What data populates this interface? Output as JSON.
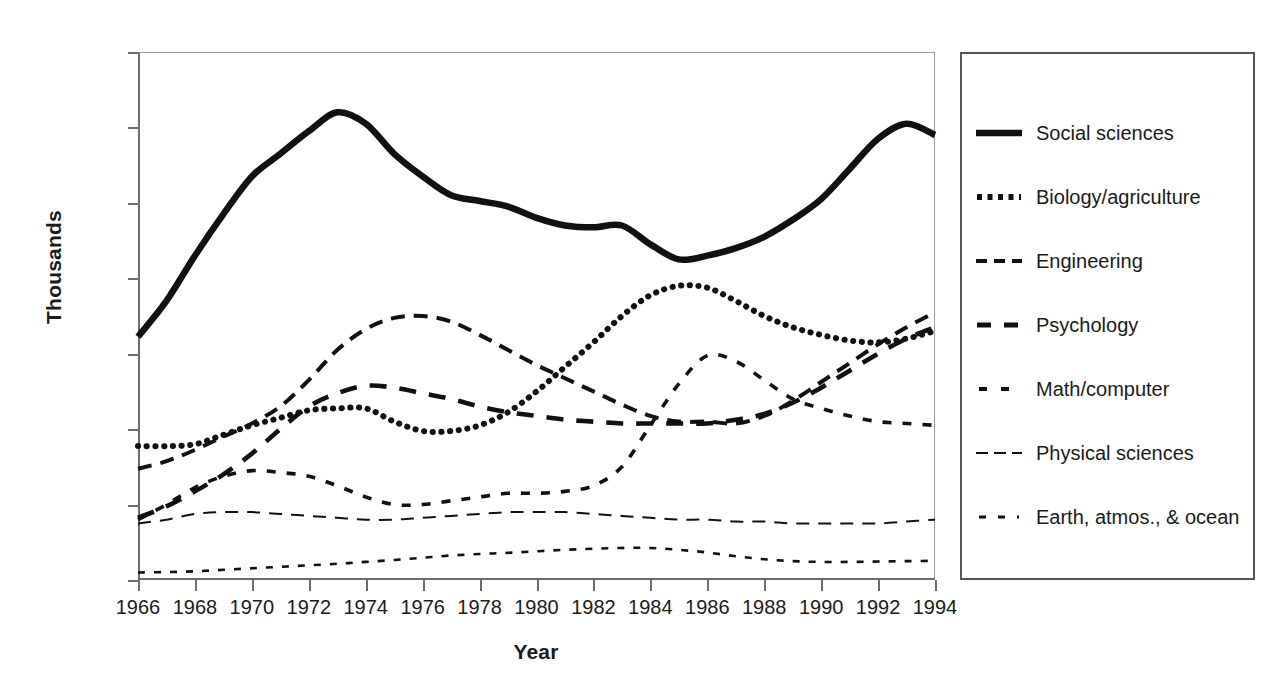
{
  "chart_data": {
    "type": "line",
    "title": "",
    "xlabel": "Year",
    "ylabel": "Thousands",
    "xlim": [
      1966,
      1994
    ],
    "ylim": [
      0,
      140
    ],
    "grid": false,
    "legend_position": "right",
    "xticks": [
      "1966",
      "1968",
      "1970",
      "1972",
      "1974",
      "1976",
      "1978",
      "1980",
      "1982",
      "1984",
      "1986",
      "1988",
      "1990",
      "1992",
      "1994"
    ],
    "yticks": [
      "0",
      "20",
      "40",
      "60",
      "80",
      "100",
      "120",
      "140"
    ],
    "x": [
      1966,
      1967,
      1968,
      1969,
      1970,
      1971,
      1972,
      1973,
      1974,
      1975,
      1976,
      1977,
      1978,
      1979,
      1980,
      1981,
      1982,
      1983,
      1984,
      1985,
      1986,
      1987,
      1988,
      1989,
      1990,
      1991,
      1992,
      1993,
      1994
    ],
    "series": [
      {
        "name": "Social sciences",
        "style": "solid-thick",
        "values": [
          64.5,
          74,
          86,
          97,
          107,
          113,
          119,
          124,
          121,
          113,
          107,
          102,
          100.5,
          99,
          96,
          94,
          93.5,
          94,
          89,
          85,
          86,
          88,
          91,
          95.5,
          101,
          109,
          117,
          121,
          118
        ]
      },
      {
        "name": "Biology/agriculture",
        "style": "dotted-thick",
        "values": [
          35.5,
          35.5,
          36,
          38.5,
          41,
          43,
          45,
          45.5,
          45.5,
          42,
          39.5,
          39.5,
          41,
          44.5,
          50,
          56.5,
          63,
          70,
          75.5,
          78,
          77.5,
          74,
          70,
          67,
          65,
          63.5,
          63,
          64,
          66
        ]
      },
      {
        "name": "Engineering",
        "style": "dashed-medium",
        "values": [
          29.5,
          31.5,
          34.5,
          38,
          41.5,
          46,
          53,
          61,
          66.5,
          69.5,
          70,
          68.5,
          65,
          61,
          57,
          53.5,
          50,
          46.5,
          43.5,
          42,
          42,
          41.5,
          43.5,
          47.5,
          52.5,
          57.5,
          62.5,
          67,
          71
        ]
      },
      {
        "name": "Psychology",
        "style": "dashed-long",
        "values": [
          16.5,
          19.5,
          23.5,
          28,
          33.5,
          40,
          46,
          49.5,
          51.5,
          51,
          49.5,
          48,
          46,
          44.5,
          43.5,
          42.5,
          42,
          41.5,
          41.5,
          41.5,
          41.5,
          42.5,
          44,
          47,
          51,
          55.5,
          60,
          64,
          67
        ]
      },
      {
        "name": "Math/computer",
        "style": "dashdot-small",
        "values": [
          16,
          20,
          24.5,
          27.5,
          29,
          28.5,
          27.5,
          25,
          22,
          20,
          20,
          21,
          22,
          23,
          23,
          23.5,
          25,
          30,
          41,
          52,
          59.5,
          58,
          53,
          48,
          45.5,
          43.5,
          42,
          41.5,
          41
        ]
      },
      {
        "name": "Physical sciences",
        "style": "dashed-thin",
        "values": [
          15,
          16,
          17.5,
          18,
          18,
          17.5,
          17,
          16.5,
          16,
          16,
          16.5,
          17,
          17.5,
          18,
          18,
          18,
          17.5,
          17,
          16.5,
          16,
          16,
          15.5,
          15.5,
          15,
          15,
          15,
          15,
          15.5,
          16
        ]
      },
      {
        "name": "Earth, atmos., & ocean",
        "style": "dotted-thin",
        "values": [
          2,
          2.1,
          2.3,
          2.7,
          3.1,
          3.5,
          3.9,
          4.3,
          4.8,
          5.3,
          5.9,
          6.5,
          6.9,
          7.2,
          7.6,
          8,
          8.3,
          8.5,
          8.5,
          8,
          7.3,
          6.3,
          5.5,
          5,
          4.8,
          4.8,
          4.9,
          5,
          5.1
        ]
      }
    ]
  },
  "legend": {
    "items": [
      {
        "label": "Social sciences",
        "sample": "solid-thick-sample"
      },
      {
        "label": "Biology/agriculture",
        "sample": "dotted-thick-sample"
      },
      {
        "label": "Engineering",
        "sample": "dashed-medium-sample"
      },
      {
        "label": "Psychology",
        "sample": "dashed-long-sample"
      },
      {
        "label": "Math/computer",
        "sample": "dashdot-small-sample"
      },
      {
        "label": "Physical sciences",
        "sample": "dashed-thin-sample"
      },
      {
        "label": "Earth, atmos., & ocean",
        "sample": "dotted-thin-sample"
      }
    ]
  }
}
